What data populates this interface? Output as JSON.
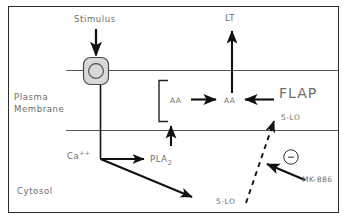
{
  "figure": {
    "background_color": "#ffffff",
    "frame_color": "#2b2b2b",
    "membrane_line_color": "#555555",
    "arrow_color": "#111111",
    "text_color": "#6d6d6d",
    "receptor_fill": "#d8d8d8"
  },
  "compartments": {
    "membrane_label_line1": "Plasma",
    "membrane_label_line2": "Membrane",
    "cytosol_label": "Cytosol"
  },
  "nodes": {
    "stimulus": "Stimulus",
    "receptor": "R",
    "leukotriene": "LT",
    "aa_bracketed": "AA",
    "aa_membrane": "AA",
    "flap": "FLAP",
    "flap_5lo": "5-LO",
    "calcium": "Ca",
    "calcium_charge": "++",
    "pla2_base": "PLA",
    "pla2_sub": "2",
    "cytosolic_5lo": "5-LO",
    "inhibitor": "MK-886",
    "inhibition_symbol": "−"
  }
}
